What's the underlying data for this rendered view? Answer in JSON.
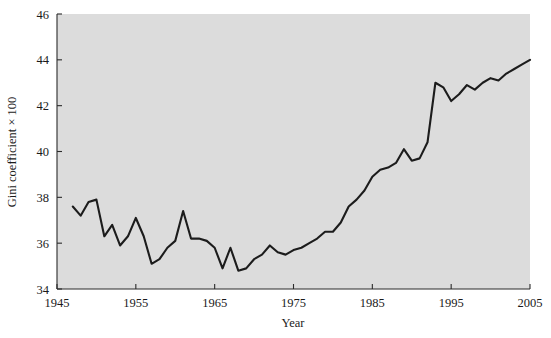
{
  "figure": {
    "background_color": "#ffffff",
    "plot_background_color": "#dcdcdc",
    "line_color": "#1c1c1c",
    "axis_color": "#2b2b2b"
  },
  "axes": {
    "x_title": "Year",
    "y_title": "Gini coefficient × 100",
    "x_ticks": [
      "1945",
      "1955",
      "1965",
      "1975",
      "1985",
      "1995",
      "2005"
    ],
    "y_ticks": [
      "34",
      "36",
      "38",
      "40",
      "42",
      "44",
      "46"
    ]
  },
  "chart_data": {
    "type": "line",
    "title": "",
    "xlabel": "Year",
    "ylabel": "Gini coefficient × 100",
    "xlim": [
      1945,
      2005
    ],
    "ylim": [
      34,
      46
    ],
    "xticks": [
      1945,
      1955,
      1965,
      1975,
      1985,
      1995,
      2005
    ],
    "yticks": [
      34,
      36,
      38,
      40,
      42,
      44,
      46
    ],
    "grid": false,
    "legend": "none",
    "x": [
      1947,
      1948,
      1949,
      1950,
      1951,
      1952,
      1953,
      1954,
      1955,
      1956,
      1957,
      1958,
      1959,
      1960,
      1961,
      1962,
      1963,
      1964,
      1965,
      1966,
      1967,
      1968,
      1969,
      1970,
      1971,
      1972,
      1973,
      1974,
      1975,
      1976,
      1977,
      1978,
      1979,
      1980,
      1981,
      1982,
      1983,
      1984,
      1985,
      1986,
      1987,
      1988,
      1989,
      1990,
      1991,
      1992,
      1993,
      1994,
      1995,
      1996,
      1997,
      1998,
      1999,
      2000,
      2001,
      2002,
      2003,
      2004,
      2005
    ],
    "y": [
      37.6,
      37.2,
      37.8,
      37.9,
      36.3,
      36.8,
      35.9,
      36.3,
      37.1,
      36.3,
      35.1,
      35.3,
      35.8,
      36.1,
      37.4,
      36.2,
      36.2,
      36.1,
      35.8,
      34.9,
      35.8,
      34.8,
      34.9,
      35.3,
      35.5,
      35.9,
      35.6,
      35.5,
      35.7,
      35.8,
      36.0,
      36.2,
      36.5,
      36.5,
      36.9,
      37.6,
      37.9,
      38.3,
      38.9,
      39.2,
      39.3,
      39.5,
      40.1,
      39.6,
      39.7,
      40.4,
      43.0,
      42.8,
      42.2,
      42.5,
      42.9,
      42.7,
      43.0,
      43.2,
      43.1,
      43.4,
      43.6,
      43.8,
      44.0
    ]
  }
}
